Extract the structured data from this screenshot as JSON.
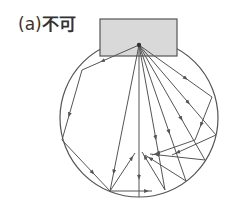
{
  "figure": {
    "label_prefix": "(a)",
    "label_text": "不可",
    "colors": {
      "line": "#555555",
      "fill": "#d9d9d9",
      "text": "#333333"
    },
    "source_box": {
      "x": 100,
      "y": 19,
      "w": 77,
      "h": 37
    },
    "source_point": {
      "x": 139,
      "y": 45
    },
    "circle": {
      "cx": 139,
      "cy": 118,
      "r": 79
    },
    "rays": [
      {
        "points": [
          [
            139,
            45
          ],
          [
            82,
            70
          ],
          [
            62,
            140
          ],
          [
            110,
            191
          ],
          [
            135,
            153
          ]
        ]
      },
      {
        "points": [
          [
            139,
            45
          ],
          [
            110,
            191
          ]
        ]
      },
      {
        "points": [
          [
            139,
            45
          ],
          [
            139,
            197
          ]
        ]
      },
      {
        "points": [
          [
            139,
            45
          ],
          [
            165,
            190
          ],
          [
            142,
            152
          ]
        ]
      },
      {
        "points": [
          [
            139,
            45
          ],
          [
            186,
            181
          ],
          [
            145,
            155
          ]
        ]
      },
      {
        "points": [
          [
            139,
            45
          ],
          [
            212,
            97
          ],
          [
            195,
            140
          ],
          [
            152,
            155
          ]
        ]
      },
      {
        "points": [
          [
            139,
            45
          ],
          [
            216,
            135
          ],
          [
            172,
            155
          ]
        ]
      },
      {
        "points": [
          [
            139,
            45
          ],
          [
            205,
            160
          ],
          [
            150,
            154
          ]
        ]
      },
      {
        "points": [
          [
            110,
            191
          ],
          [
            152,
            191
          ]
        ]
      }
    ]
  }
}
